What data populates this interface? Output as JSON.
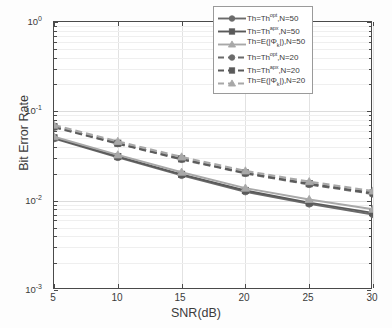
{
  "chart_data": {
    "type": "line",
    "title": "",
    "xlabel": "SNR(dB)",
    "ylabel": "Bit Error Rate",
    "yscale": "log",
    "xlim": [
      5,
      30
    ],
    "ylim": [
      0.001,
      1
    ],
    "grid": true,
    "legend_position": "upper-right",
    "x": [
      5,
      10,
      15,
      20,
      25,
      30
    ],
    "xticks": [
      "5",
      "10",
      "15",
      "20",
      "25",
      "30"
    ],
    "yticks": [
      "10⁰",
      "10⁻¹",
      "10⁻²",
      "10⁻³"
    ],
    "ytick_exponents": [
      "0",
      "-1",
      "-2",
      "-3"
    ],
    "series": [
      {
        "name": "Th=Th^opt,N=50",
        "marker": "circle",
        "linestyle": "solid",
        "color": "#6b6b6b",
        "values": [
          0.0495,
          0.0305,
          0.0192,
          0.0126,
          0.0092,
          0.007
        ]
      },
      {
        "name": "Th=Th^apx,N=50",
        "marker": "square",
        "linestyle": "solid",
        "color": "#5a5a5a",
        "values": [
          0.0505,
          0.0312,
          0.0197,
          0.013,
          0.0095,
          0.0073
        ]
      },
      {
        "name": "Th=E(|Phi_k|),N=50",
        "marker": "triangle",
        "linestyle": "solid",
        "color": "#a8a8a8",
        "values": [
          0.052,
          0.0325,
          0.0208,
          0.0138,
          0.0103,
          0.008
        ]
      },
      {
        "name": "Th=Th^opt,N=20",
        "marker": "circle",
        "linestyle": "dashed",
        "color": "#6b6b6b",
        "values": [
          0.0665,
          0.0435,
          0.029,
          0.0202,
          0.0152,
          0.0119
        ]
      },
      {
        "name": "Th=Th^apx,N=20",
        "marker": "square",
        "linestyle": "dashed",
        "color": "#5a5a5a",
        "values": [
          0.0672,
          0.044,
          0.0294,
          0.0205,
          0.0155,
          0.0122
        ]
      },
      {
        "name": "Th=E(|Phi_k|),N=20",
        "marker": "triangle",
        "linestyle": "dashed",
        "color": "#a8a8a8",
        "values": [
          0.07,
          0.046,
          0.0308,
          0.0215,
          0.0163,
          0.0128
        ]
      }
    ]
  },
  "axes": {
    "x_title": "SNR(dB)",
    "y_title": "Bit Error Rate",
    "x_ticks": [
      "5",
      "10",
      "15",
      "20",
      "25",
      "30"
    ],
    "y_ticks": [
      {
        "base": "10",
        "exp": "0"
      },
      {
        "base": "10",
        "exp": "-1"
      },
      {
        "base": "10",
        "exp": "-2"
      },
      {
        "base": "10",
        "exp": "-3"
      }
    ]
  },
  "legend": {
    "entries": [
      {
        "prefix": "Th=Th",
        "sup": "opt",
        "mid": ",N=50",
        "phi": false,
        "style": "solid",
        "marker": "circle",
        "color": "#6b6b6b"
      },
      {
        "prefix": "Th=Th",
        "sup": "apx",
        "mid": ",N=50",
        "phi": false,
        "style": "solid",
        "marker": "square",
        "color": "#5a5a5a"
      },
      {
        "prefix": "Th=E(|",
        "sup": "",
        "mid": "|),N=50",
        "phi": true,
        "style": "solid",
        "marker": "triangle",
        "color": "#a8a8a8"
      },
      {
        "prefix": "Th=Th",
        "sup": "opt",
        "mid": ",N=20",
        "phi": false,
        "style": "dashed",
        "marker": "circle",
        "color": "#6b6b6b"
      },
      {
        "prefix": "Th=Th",
        "sup": "apx",
        "mid": ",N=20",
        "phi": false,
        "style": "dashed",
        "marker": "square",
        "color": "#5a5a5a"
      },
      {
        "prefix": "Th=E(|",
        "sup": "",
        "mid": "|),N=20",
        "phi": true,
        "style": "dashed",
        "marker": "triangle",
        "color": "#a8a8a8"
      }
    ],
    "phi_symbol": "Φ",
    "phi_sub": "k"
  },
  "colors": {
    "axis": "#4a4a4a",
    "grid": "#e2e2e2",
    "background": "#ffffff"
  }
}
